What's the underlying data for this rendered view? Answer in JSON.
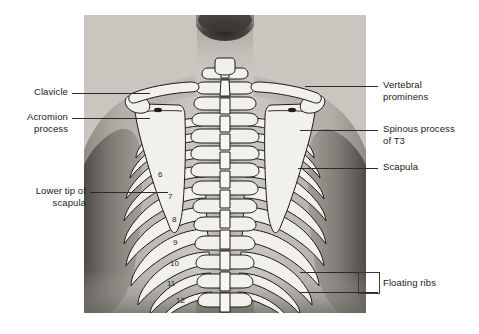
{
  "figure": {
    "photo": {
      "x": 84,
      "y": 15,
      "width": 282,
      "height": 298
    },
    "colors": {
      "bone_fill": "#f2f0ea",
      "bone_outline": "#1d1d1d",
      "skin_light": "#c9c5bf",
      "skin_mid": "#a8a39c",
      "skin_dark": "#6e6a65",
      "shadow": "#4a4742",
      "leader": "#2b2b2b",
      "text": "#1a1a1a",
      "page_bg": "#ffffff"
    }
  },
  "labels": {
    "left": [
      {
        "id": "clavicle",
        "text": "Clavicle",
        "lines": [
          "Clavicle"
        ],
        "align": "right",
        "x": 38,
        "y": 86,
        "leader": {
          "x1": 72,
          "x2": 150,
          "y": 93
        }
      },
      {
        "id": "acromion-process",
        "text": "Acromion process",
        "lines": [
          "Acromion",
          "process"
        ],
        "align": "right",
        "x": 22,
        "y": 111,
        "leader": {
          "x1": 72,
          "x2": 150,
          "y": 118
        }
      },
      {
        "id": "lower-tip-of-scapula",
        "text": "Lower tip of scapula",
        "lines": [
          "Lower tip of",
          "scapula"
        ],
        "align": "right",
        "x": 22,
        "y": 185,
        "leader": {
          "x1": 90,
          "x2": 168,
          "y": 192
        }
      }
    ],
    "right": [
      {
        "id": "vertebral-prominens",
        "text": "Vertebral prominens",
        "lines": [
          "Vertebral",
          "prominens"
        ],
        "align": "left",
        "x": 383,
        "y": 79,
        "leader": {
          "x1": 305,
          "x2": 378,
          "y": 86
        }
      },
      {
        "id": "spinous-process-of-t3",
        "text": "Spinous process of T3",
        "lines": [
          "Spinous process",
          "of T3"
        ],
        "align": "left",
        "x": 383,
        "y": 123,
        "leader": {
          "x1": 300,
          "x2": 378,
          "y": 130
        }
      },
      {
        "id": "scapula",
        "text": "Scapula",
        "lines": [
          "Scapula"
        ],
        "align": "left",
        "x": 383,
        "y": 161,
        "leader": {
          "x1": 298,
          "x2": 378,
          "y": 168
        }
      },
      {
        "id": "floating-ribs",
        "text": "Floating ribs",
        "lines": [
          "Floating ribs"
        ],
        "align": "left",
        "x": 383,
        "y": 277,
        "bracket": {
          "x": 358,
          "y": 272,
          "width": 20,
          "height": 21
        },
        "leader_top": {
          "x1": 300,
          "x2": 378,
          "y": 272
        },
        "leader_bottom": {
          "x1": 300,
          "x2": 378,
          "y": 293
        }
      }
    ]
  },
  "rib_numbers": [
    {
      "n": "6",
      "x": 158,
      "y": 177
    },
    {
      "n": "7",
      "x": 168,
      "y": 199
    },
    {
      "n": "8",
      "x": 172,
      "y": 222
    },
    {
      "n": "9",
      "x": 173,
      "y": 245
    },
    {
      "n": "10",
      "x": 170,
      "y": 266
    },
    {
      "n": "11",
      "x": 167,
      "y": 286
    },
    {
      "n": "12",
      "x": 176,
      "y": 303
    }
  ],
  "structures": [
    {
      "id": "clavicle-left",
      "name": "Left clavicle"
    },
    {
      "id": "clavicle-right",
      "name": "Right clavicle"
    },
    {
      "id": "scapula-left",
      "name": "Left scapula"
    },
    {
      "id": "scapula-right",
      "name": "Right scapula"
    },
    {
      "id": "vertebral-column",
      "name": "Thoracic vertebral column"
    },
    {
      "id": "rib-cage",
      "name": "Rib cage, ribs 6-12 visible"
    }
  ]
}
